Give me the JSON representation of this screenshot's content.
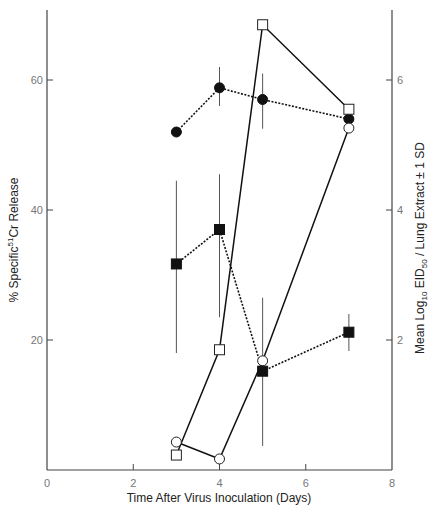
{
  "chart_data": {
    "type": "line",
    "title": "",
    "xlabel": "Time After Virus Inoculation (Days)",
    "ylabel_left": {
      "prefix": "% Specific",
      "sup": "51",
      "suffix": "Cr Release"
    },
    "ylabel_right": {
      "p1": "Mean Log",
      "sub1": "10",
      "p2": " EID",
      "sub2": "50",
      "p3": " / Lung Extract ± 1 SD"
    },
    "xlim": [
      0,
      8
    ],
    "ylim_left": [
      0,
      70
    ],
    "ylim_right": [
      0,
      7
    ],
    "x_ticks": [
      0,
      2,
      4,
      6,
      8
    ],
    "y_ticks_left": [
      20,
      40,
      60
    ],
    "y_ticks_right": [
      2,
      4,
      6
    ],
    "grid": false,
    "legend": null,
    "series": [
      {
        "name": "filled-circle",
        "axis": "left",
        "marker": "filled-circle",
        "line": "dotted",
        "x": [
          3,
          4,
          5,
          7
        ],
        "values": [
          52,
          58.8,
          57,
          54
        ],
        "err": [
          null,
          [
            56,
            62
          ],
          [
            52.5,
            61
          ],
          null
        ]
      },
      {
        "name": "open-circle",
        "axis": "left",
        "marker": "open-circle",
        "line": "solid",
        "x": [
          3,
          4,
          5,
          7
        ],
        "values": [
          4.3,
          1.7,
          16.8,
          52.6
        ],
        "err": [
          null,
          null,
          null,
          null
        ]
      },
      {
        "name": "filled-square",
        "axis": "right",
        "marker": "filled-square",
        "line": "dotted",
        "x": [
          3,
          4,
          5,
          7
        ],
        "values": [
          3.17,
          3.7,
          1.52,
          2.12
        ],
        "err": [
          [
            1.8,
            4.45
          ],
          [
            2.35,
            4.55
          ],
          [
            0.37,
            2.65
          ],
          [
            1.83,
            2.4
          ]
        ]
      },
      {
        "name": "open-square",
        "axis": "right",
        "marker": "open-square",
        "line": "solid",
        "x": [
          3,
          4,
          5,
          7
        ],
        "values": [
          0.23,
          1.85,
          6.85,
          5.55
        ],
        "err": [
          null,
          null,
          null,
          null
        ]
      }
    ]
  }
}
